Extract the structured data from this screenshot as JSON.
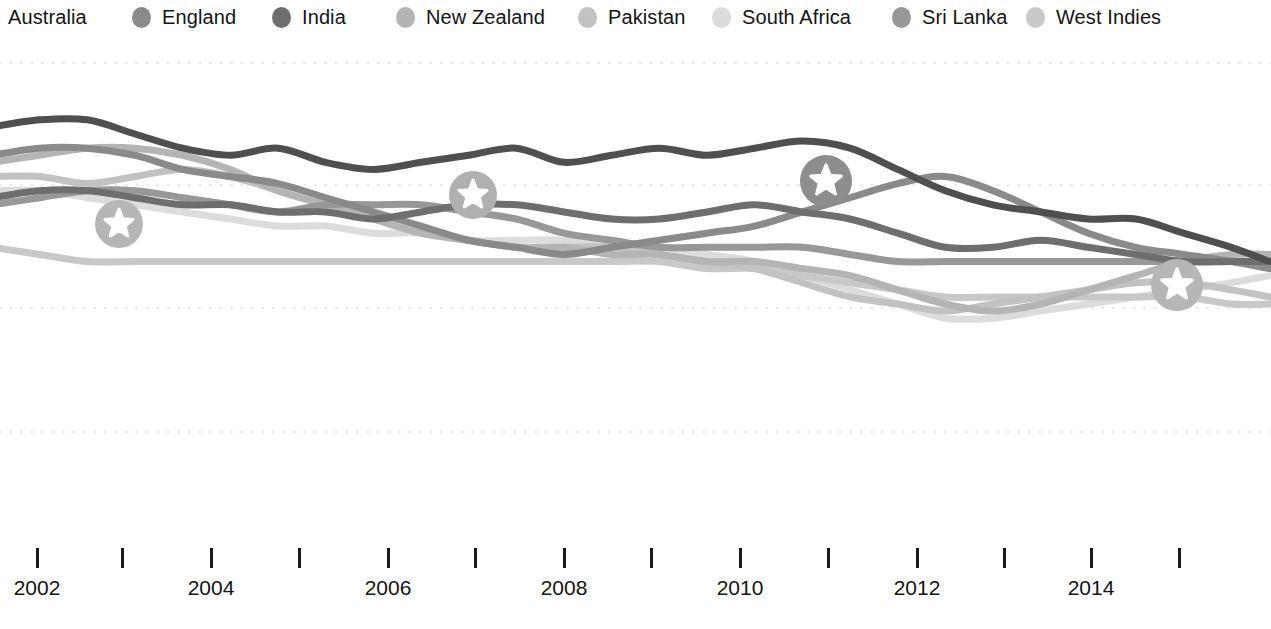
{
  "legend": {
    "items": [
      {
        "label": "Australia",
        "color": "#4f4f4f",
        "show_dot": false,
        "x": 8
      },
      {
        "label": "England",
        "color": "#8a8a8a",
        "show_dot": true,
        "x": 132
      },
      {
        "label": "India",
        "color": "#6e6e6e",
        "show_dot": true,
        "x": 272
      },
      {
        "label": "New Zealand",
        "color": "#b4b4b4",
        "show_dot": true,
        "x": 396
      },
      {
        "label": "Pakistan",
        "color": "#c2c2c2",
        "show_dot": true,
        "x": 578
      },
      {
        "label": "South Africa",
        "color": "#dcdcdc",
        "show_dot": true,
        "x": 712
      },
      {
        "label": "Sri Lanka",
        "color": "#989898",
        "show_dot": true,
        "x": 892
      },
      {
        "label": "West Indies",
        "color": "#c8c8c8",
        "show_dot": true,
        "x": 1026
      }
    ]
  },
  "axis": {
    "ticks": [
      {
        "x": 36,
        "label": "2002"
      },
      {
        "x": 121,
        "label": ""
      },
      {
        "x": 210,
        "label": "2004"
      },
      {
        "x": 298,
        "label": ""
      },
      {
        "x": 387,
        "label": "2006"
      },
      {
        "x": 474,
        "label": ""
      },
      {
        "x": 563,
        "label": "2008"
      },
      {
        "x": 650,
        "label": ""
      },
      {
        "x": 739,
        "label": "2010"
      },
      {
        "x": 827,
        "label": ""
      },
      {
        "x": 916,
        "label": "2012"
      },
      {
        "x": 1003,
        "label": ""
      },
      {
        "x": 1090,
        "label": "2014"
      },
      {
        "x": 1178,
        "label": ""
      }
    ]
  },
  "gridlines": {
    "color": "#e8e8e8",
    "y_positions": [
      29,
      151,
      274,
      398
    ]
  },
  "markers": {
    "circle_fill_default": "#b6b6b6",
    "star_fill": "#ffffff",
    "items": [
      {
        "cx": 119,
        "cy": 190,
        "r": 24,
        "fill": "#b6b6b6",
        "name": "star-marker-1"
      },
      {
        "cx": 473,
        "cy": 161,
        "r": 24,
        "fill": "#b0b0b0",
        "name": "star-marker-2"
      },
      {
        "cx": 826,
        "cy": 147,
        "r": 26,
        "fill": "#8d8d8d",
        "name": "star-marker-3"
      },
      {
        "cx": 1177,
        "cy": 251,
        "r": 26,
        "fill": "#b6b6b6",
        "name": "star-marker-4"
      }
    ]
  },
  "chart_data": {
    "type": "line",
    "title": "",
    "subtitle": "",
    "xlabel": "",
    "ylabel": "",
    "grid": true,
    "legend_position": "top",
    "xlim": [
      2002.0,
      2015.5
    ],
    "ylim": [
      80,
      140
    ],
    "x_tick_labels": [
      "2002",
      "2004",
      "2006",
      "2008",
      "2010",
      "2012",
      "2014"
    ],
    "x_minor_tick_interval": 0.5,
    "y_gridline_values": [
      135,
      120,
      105,
      90
    ],
    "annotations": [
      {
        "label": "No. 1 ranked team",
        "x": 2002.9,
        "y": 118
      },
      {
        "label": "No. 1 ranked team",
        "x": 2006.9,
        "y": 121
      },
      {
        "label": "No. 1 ranked team",
        "x": 2010.9,
        "y": 123
      },
      {
        "label": "No. 1 ranked team",
        "x": 2015.0,
        "y": 110
      }
    ],
    "x": [
      2002.0,
      2002.5,
      2003.0,
      2003.5,
      2004.0,
      2004.5,
      2005.0,
      2005.5,
      2006.0,
      2006.5,
      2007.0,
      2007.5,
      2008.0,
      2008.5,
      2009.0,
      2009.5,
      2010.0,
      2010.5,
      2011.0,
      2011.5,
      2012.0,
      2012.5,
      2013.0,
      2013.5,
      2014.0,
      2014.5,
      2015.0,
      2015.4
    ],
    "series": [
      {
        "name": "Australia",
        "color": "#4f4f4f",
        "values": [
          129,
          130,
          130,
          128,
          126,
          125,
          126,
          124,
          123,
          124,
          125,
          126,
          124,
          125,
          126,
          125,
          126,
          127,
          126,
          123,
          120,
          118,
          117,
          116,
          116,
          114,
          112,
          110
        ]
      },
      {
        "name": "England",
        "color": "#8a8a8a",
        "values": [
          125,
          126,
          126,
          125,
          123,
          122,
          121,
          119,
          117,
          115,
          113,
          112,
          111,
          112,
          113,
          114,
          115,
          117,
          119,
          121,
          122,
          120,
          117,
          114,
          112,
          111,
          110,
          109
        ]
      },
      {
        "name": "India",
        "color": "#6e6e6e",
        "values": [
          119,
          120,
          120,
          119,
          118,
          118,
          117,
          117,
          116,
          117,
          118,
          118,
          117,
          116,
          116,
          117,
          118,
          117,
          116,
          114,
          112,
          112,
          113,
          112,
          111,
          110,
          110,
          110
        ]
      },
      {
        "name": "New Zealand",
        "color": "#b4b4b4",
        "values": [
          124,
          125,
          126,
          126,
          125,
          123,
          120,
          118,
          116,
          114,
          113,
          112,
          112,
          111,
          111,
          110,
          110,
          109,
          108,
          106,
          104,
          103,
          104,
          106,
          108,
          110,
          111,
          111
        ]
      },
      {
        "name": "Pakistan",
        "color": "#c2c2c2",
        "values": [
          122,
          122,
          121,
          122,
          123,
          122,
          120,
          118,
          116,
          114,
          113,
          112,
          112,
          112,
          111,
          110,
          109,
          107,
          105,
          104,
          103,
          104,
          105,
          106,
          107,
          107,
          106,
          105
        ]
      },
      {
        "name": "South Africa",
        "color": "#dcdcdc",
        "values": [
          120,
          120,
          119,
          118,
          117,
          116,
          115,
          115,
          114,
          114,
          113,
          113,
          113,
          112,
          112,
          111,
          110,
          108,
          106,
          104,
          102,
          102,
          103,
          104,
          105,
          106,
          107,
          108
        ]
      },
      {
        "name": "Sri Lanka",
        "color": "#989898",
        "values": [
          118,
          119,
          120,
          120,
          119,
          118,
          117,
          118,
          118,
          118,
          117,
          116,
          114,
          113,
          112,
          112,
          112,
          112,
          111,
          110,
          110,
          110,
          110,
          110,
          110,
          110,
          110,
          110
        ]
      },
      {
        "name": "West Indies",
        "color": "#c8c8c8",
        "values": [
          112,
          111,
          110,
          110,
          110,
          110,
          110,
          110,
          110,
          110,
          110,
          110,
          110,
          110,
          110,
          109,
          109,
          108,
          107,
          106,
          105,
          105,
          105,
          105,
          105,
          105,
          104,
          104
        ]
      }
    ]
  }
}
